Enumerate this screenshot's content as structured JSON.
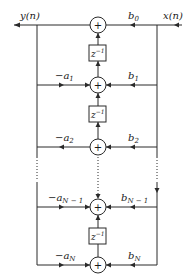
{
  "diagram": {
    "output_label": "y(n)",
    "input_label": "x(n)",
    "delay_label": {
      "base": "z",
      "exp": "−1"
    },
    "adder_symbol": "+",
    "stages": [
      {
        "index": 0,
        "feedback": null,
        "feedforward": {
          "base": "b",
          "sub": "0"
        }
      },
      {
        "index": 1,
        "feedback": {
          "base": "−a",
          "sub": "1"
        },
        "feedforward": {
          "base": "b",
          "sub": "1"
        }
      },
      {
        "index": 2,
        "feedback": {
          "base": "−a",
          "sub": "2"
        },
        "feedforward": {
          "base": "b",
          "sub": "2"
        }
      },
      {
        "index": "N-1",
        "feedback": {
          "base": "−a",
          "sub": "N − 1"
        },
        "feedforward": {
          "base": "b",
          "sub": "N − 1"
        }
      },
      {
        "index": "N",
        "feedback": {
          "base": "−a",
          "sub": "N"
        },
        "feedforward": {
          "base": "b",
          "sub": "N"
        }
      }
    ],
    "colors": {
      "stroke": "#2a2a2a",
      "background": "#ffffff"
    }
  }
}
